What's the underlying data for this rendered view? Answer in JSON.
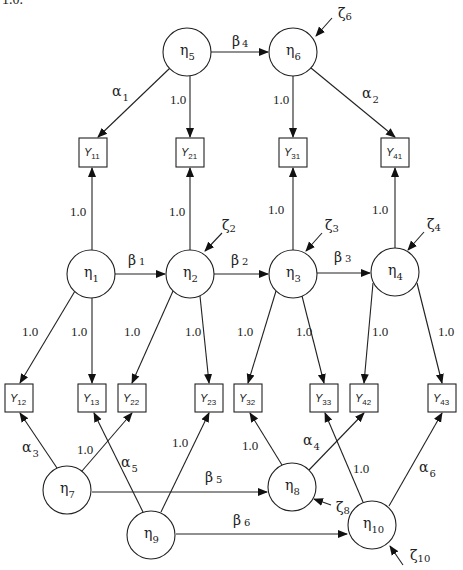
{
  "header": {
    "cut_text": "1.0."
  },
  "nodes": {
    "eta1": {
      "sym": "η",
      "sub": "1",
      "cx": 91,
      "cy": 274
    },
    "eta2": {
      "sym": "η",
      "sub": "2",
      "cx": 190,
      "cy": 274
    },
    "eta3": {
      "sym": "η",
      "sub": "3",
      "cx": 293,
      "cy": 274
    },
    "eta4": {
      "sym": "η",
      "sub": "4",
      "cx": 395,
      "cy": 272
    },
    "eta5": {
      "sym": "η",
      "sub": "5",
      "cx": 187,
      "cy": 52
    },
    "eta6": {
      "sym": "η",
      "sub": "6",
      "cx": 293,
      "cy": 52
    },
    "eta7": {
      "sym": "η",
      "sub": "7",
      "cx": 67,
      "cy": 490
    },
    "eta8": {
      "sym": "η",
      "sub": "8",
      "cx": 292,
      "cy": 487
    },
    "eta9": {
      "sym": "η",
      "sub": "9",
      "cx": 151,
      "cy": 535
    },
    "eta10": {
      "sym": "η",
      "sub": "10",
      "cx": 372,
      "cy": 525
    }
  },
  "indicators": {
    "Y11": {
      "sym": "Y",
      "sub": "11"
    },
    "Y21": {
      "sym": "Y",
      "sub": "21"
    },
    "Y31": {
      "sym": "Y",
      "sub": "31"
    },
    "Y41": {
      "sym": "Y",
      "sub": "41"
    },
    "Y12": {
      "sym": "Y",
      "sub": "12"
    },
    "Y13": {
      "sym": "Y",
      "sub": "13"
    },
    "Y22": {
      "sym": "Y",
      "sub": "22"
    },
    "Y23": {
      "sym": "Y",
      "sub": "23"
    },
    "Y32": {
      "sym": "Y",
      "sub": "32"
    },
    "Y33": {
      "sym": "Y",
      "sub": "33"
    },
    "Y42": {
      "sym": "Y",
      "sub": "42"
    },
    "Y43": {
      "sym": "Y",
      "sub": "43"
    }
  },
  "paths": {
    "beta1": {
      "sym": "β",
      "sub": "1"
    },
    "beta2": {
      "sym": "β",
      "sub": "2"
    },
    "beta3": {
      "sym": "β",
      "sub": "3"
    },
    "beta4": {
      "sym": "β",
      "sub": "4"
    },
    "beta5": {
      "sym": "β",
      "sub": "5"
    },
    "beta6": {
      "sym": "β",
      "sub": "6"
    },
    "alpha1": {
      "sym": "α",
      "sub": "1"
    },
    "alpha2": {
      "sym": "α",
      "sub": "2"
    },
    "alpha3": {
      "sym": "α",
      "sub": "3"
    },
    "alpha4": {
      "sym": "α",
      "sub": "4"
    },
    "alpha5": {
      "sym": "α",
      "sub": "5"
    },
    "alpha6": {
      "sym": "α",
      "sub": "6"
    },
    "fixed": "1.0"
  },
  "disturbances": {
    "zeta2": {
      "sym": "ζ",
      "sub": "2"
    },
    "zeta3": {
      "sym": "ζ",
      "sub": "3"
    },
    "zeta4": {
      "sym": "ζ",
      "sub": "4"
    },
    "zeta6": {
      "sym": "ζ",
      "sub": "6"
    },
    "zeta8": {
      "sym": "ζ",
      "sub": "8"
    },
    "zeta10": {
      "sym": "ζ",
      "sub": "10"
    }
  }
}
